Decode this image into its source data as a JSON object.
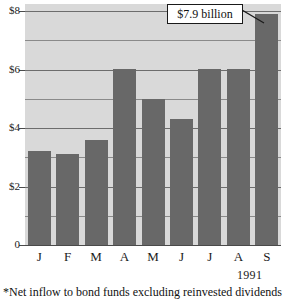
{
  "chart_data": {
    "type": "bar",
    "title": "",
    "subtitle": "",
    "xlabel": "1991",
    "ylabel": "",
    "categories": [
      "J",
      "F",
      "M",
      "A",
      "M",
      "J",
      "J",
      "A",
      "S"
    ],
    "values": [
      3.2,
      3.1,
      3.6,
      6.0,
      5.0,
      4.3,
      6.0,
      6.0,
      7.9
    ],
    "ylim": [
      0,
      8
    ],
    "ytick_values": [
      0,
      2,
      4,
      6,
      8
    ],
    "ytick_labels": [
      "0",
      "$2",
      "$4",
      "$6",
      "$8"
    ],
    "minor_gridline_values": [
      1,
      3,
      5,
      7
    ],
    "grid": true,
    "legend": "none",
    "annotations": [
      {
        "text": "$7.9 billion",
        "target_category": "S",
        "target_value": 7.9
      }
    ],
    "footnote": "*Net inflow to bond funds excluding reinvested dividends",
    "colors": {
      "bar": "#686868",
      "plot_background": "#d9d9d9",
      "gridline": "#6d6d6d",
      "minor_gridline": "#8a8a8a",
      "axis": "#4a4a4a",
      "text": "#111111",
      "callout_background": "#ffffff",
      "callout_border": "#1a1a1a"
    }
  },
  "axis": {
    "year_label": "1991"
  },
  "callout": {
    "label": "$7.9 billion"
  },
  "footnote": {
    "text": "*Net inflow to bond funds excluding reinvested dividends"
  }
}
